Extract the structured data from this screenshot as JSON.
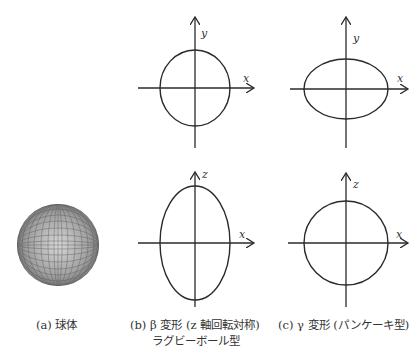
{
  "figure": {
    "panels": [
      {
        "id": "a",
        "caption": "(a) 球体",
        "shape": "sphere-mesh"
      },
      {
        "id": "b",
        "caption_line1": "(b) β 変形 (z 軸回転対称)",
        "caption_line2": "ラグビーボール型",
        "top_plot": {
          "h_axis": "x",
          "v_axis": "y",
          "shape": "circle"
        },
        "bottom_plot": {
          "h_axis": "x",
          "v_axis": "z",
          "shape": "prolate-ellipse"
        }
      },
      {
        "id": "c",
        "caption": "(c) γ 変形 (パンケーキ型)",
        "top_plot": {
          "h_axis": "x",
          "v_axis": "y",
          "shape": "oblate-ellipse"
        },
        "bottom_plot": {
          "h_axis": "x",
          "v_axis": "z",
          "shape": "circle"
        }
      }
    ],
    "colors": {
      "line": "#2a2a2a",
      "sphere": "#7a7a7a"
    }
  }
}
